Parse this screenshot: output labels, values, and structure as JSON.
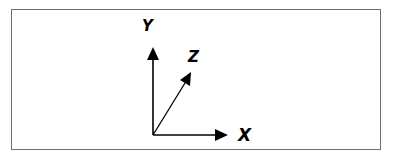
{
  "diagram": {
    "colors": {
      "line": "#000000",
      "frame": "#6e6e6e",
      "background": "#ffffff"
    },
    "origin": {
      "x": 153,
      "y": 135
    },
    "axes": [
      {
        "name": "x-axis",
        "label": "X",
        "tip": {
          "x": 227,
          "y": 135
        }
      },
      {
        "name": "y-axis",
        "label": "Y",
        "tip": {
          "x": 153,
          "y": 48
        }
      },
      {
        "name": "z-axis",
        "label": "Z",
        "tip": {
          "x": 191,
          "y": 73
        }
      }
    ]
  }
}
